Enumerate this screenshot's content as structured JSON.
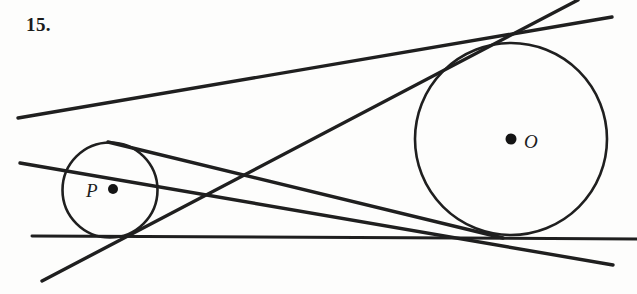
{
  "figure": {
    "problem_number": "15.",
    "background_color": "#fdfdfc",
    "stroke_color": "#1f1f1f",
    "width": 637,
    "height": 294
  },
  "circles": [
    {
      "id": "circle-p",
      "label": "P",
      "center_x": 110,
      "center_y": 190,
      "radius": 47.5,
      "label_x": 86,
      "label_y": 180,
      "dot_x": 113,
      "dot_y": 189,
      "dot_radius": 5
    },
    {
      "id": "circle-o",
      "label": "O",
      "center_x": 511,
      "center_y": 139,
      "radius": 96,
      "label_x": 524,
      "label_y": 131,
      "dot_x": 511,
      "dot_y": 139,
      "dot_radius": 5.5
    }
  ],
  "lines": [
    {
      "id": "tangent-line-bottom",
      "name": "horizontal-external-tangent",
      "x1": 32,
      "y1": 236,
      "x2": 637,
      "y2": 239
    },
    {
      "id": "tangent-line-upper-external",
      "name": "upper-external-tangent",
      "x1": 18,
      "y1": 118,
      "x2": 612,
      "y2": 17
    },
    {
      "id": "tangent-line-lower-internal",
      "name": "lower-internal-tangent",
      "x1": 20,
      "y1": 163,
      "x2": 613,
      "y2": 265
    },
    {
      "id": "tangent-line-rising-internal",
      "name": "rising-internal-tangent",
      "x1": 42,
      "y1": 281,
      "x2": 578,
      "y2": 0
    },
    {
      "id": "tangent-line-lower-external",
      "name": "lower-external-tangent",
      "x1": 108,
      "y1": 142,
      "x2": 503,
      "y2": 238
    }
  ],
  "chart_data": {
    "type": "diagram",
    "title": "15.",
    "shapes": [
      "circle-p",
      "circle-o",
      "five-tangent-lines"
    ]
  }
}
